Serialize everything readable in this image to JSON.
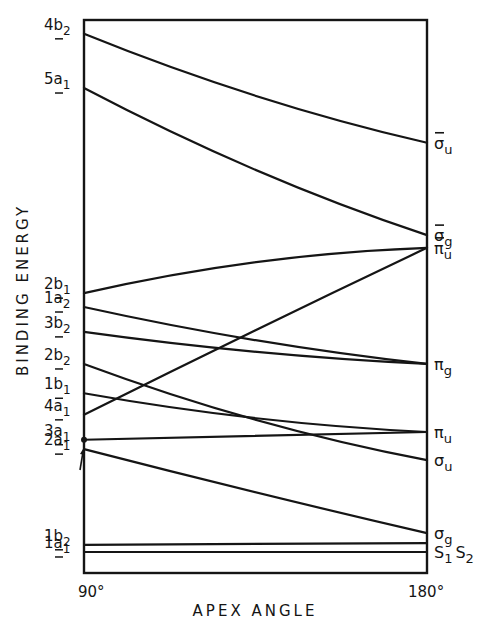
{
  "chart_data": {
    "type": "line",
    "title": "",
    "xlabel": "APEX ANGLE",
    "ylabel": "BINDING ENERGY",
    "x_ticks": [
      "90°",
      "180°"
    ],
    "xlim": [
      90,
      180
    ],
    "ylim": [
      0,
      100
    ],
    "y_units": "relative (no numeric scale shown)",
    "grid": false,
    "legend": "none",
    "series": [
      {
        "name": "4b2",
        "left_label": {
          "main": "4b",
          "sub": "2"
        },
        "right_label": {
          "main": "σ",
          "sub": "u",
          "bar": true
        },
        "x": [
          90,
          135,
          180
        ],
        "values": [
          97.5,
          86.3,
          77.8
        ]
      },
      {
        "name": "5a1",
        "left_label": {
          "main": "5a",
          "sub": "1"
        },
        "right_label": {
          "main": "σ",
          "sub": "g",
          "bar": true
        },
        "x": [
          90,
          135,
          180
        ],
        "values": [
          87.7,
          72.9,
          61.1
        ]
      },
      {
        "name": "2b1",
        "left_label": {
          "main": "2b",
          "sub": "1"
        },
        "right_label": {
          "main": "π",
          "sub": "u",
          "bar": true
        },
        "x": [
          90,
          135,
          180
        ],
        "values": [
          50.6,
          56.2,
          58.8
        ]
      },
      {
        "name": "1a2",
        "left_label": {
          "main": "1a",
          "sub": "2"
        },
        "right_label": {
          "main": "π",
          "sub": "g",
          "bar": false
        },
        "x": [
          90,
          135,
          180
        ],
        "values": [
          48.1,
          42.1,
          37.8
        ]
      },
      {
        "name": "3b2",
        "left_label": {
          "main": "3b",
          "sub": "2"
        },
        "right_label": null,
        "x": [
          90,
          135,
          180
        ],
        "values": [
          43.6,
          40.0,
          37.8
        ]
      },
      {
        "name": "2b2",
        "left_label": {
          "main": "2b",
          "sub": "2"
        },
        "right_label": {
          "main": "σ",
          "sub": "u",
          "bar": false
        },
        "x": [
          90,
          135,
          180
        ],
        "values": [
          37.8,
          27.7,
          20.4
        ]
      },
      {
        "name": "1b1",
        "left_label": {
          "main": "1b",
          "sub": "1"
        },
        "right_label": {
          "main": "π",
          "sub": "u",
          "bar": false
        },
        "x": [
          90,
          135,
          180
        ],
        "values": [
          32.5,
          28.0,
          25.5
        ]
      },
      {
        "name": "4a1",
        "left_label": {
          "main": "4a",
          "sub": "1"
        },
        "right_label": null,
        "x": [
          90,
          135,
          180
        ],
        "values": [
          28.6,
          43.9,
          58.8
        ]
      },
      {
        "name": "3a1",
        "left_label": {
          "main": "3a",
          "sub": "1"
        },
        "right_label": null,
        "x": [
          90,
          135,
          180
        ],
        "values": [
          24.1,
          24.8,
          25.5
        ]
      },
      {
        "name": "2a1",
        "left_label": {
          "main": "2a",
          "sub": "1"
        },
        "right_label": {
          "main": "σ",
          "sub": "g",
          "bar": false
        },
        "x": [
          90,
          135,
          180
        ],
        "values": [
          22.4,
          14.6,
          7.2
        ]
      },
      {
        "name": "1b2",
        "left_label": {
          "main": "1b",
          "sub": "2"
        },
        "right_label": null,
        "x": [
          90,
          135,
          180
        ],
        "values": [
          5.1,
          5.2,
          5.4
        ]
      },
      {
        "name": "1a1",
        "left_label": {
          "main": "1a",
          "sub": "1"
        },
        "right_label": {
          "main": "S",
          "sub": "1",
          "main2": "S",
          "sub2": "2",
          "bar": false
        },
        "x": [
          90,
          135,
          180
        ],
        "values": [
          3.8,
          3.8,
          3.8
        ]
      }
    ]
  }
}
